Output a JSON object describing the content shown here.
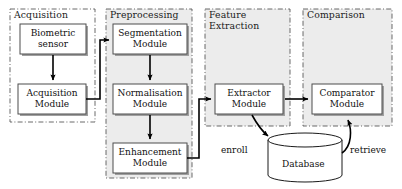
{
  "diagram": {
    "colors": {
      "container_fill_gray": "#ececec",
      "container_fill_white": "#ffffff",
      "container_border": "#555555",
      "module_fill": "#ffffff",
      "module_border": "#4d4d4d",
      "module_shadow": "#9a9a9a",
      "arrow": "#000000",
      "text": "#111111"
    },
    "stages": [
      {
        "key": "acquisition",
        "label": "Acquisition",
        "filled": false,
        "x": 10,
        "y": 9,
        "w": 85,
        "h": 113
      },
      {
        "key": "preprocessing",
        "label": "Preprocessing",
        "filled": true,
        "x": 106,
        "y": 9,
        "w": 86,
        "h": 169
      },
      {
        "key": "feature_extraction",
        "label": "Feature\nExtraction",
        "filled": true,
        "x": 205,
        "y": 9,
        "w": 85,
        "h": 117
      },
      {
        "key": "comparison",
        "label": "Comparison",
        "filled": true,
        "x": 303,
        "y": 9,
        "w": 89,
        "h": 117
      }
    ],
    "modules": [
      {
        "key": "biometric_sensor",
        "lines": [
          "Biometric",
          "sensor"
        ],
        "x": 20,
        "y": 24,
        "w": 66,
        "h": 30
      },
      {
        "key": "acquisition_module",
        "lines": [
          "Acquisition",
          "Module"
        ],
        "x": 18,
        "y": 84,
        "w": 68,
        "h": 30
      },
      {
        "key": "segmentation_module",
        "lines": [
          "Segmentation",
          "Module"
        ],
        "x": 113,
        "y": 24,
        "w": 74,
        "h": 30
      },
      {
        "key": "normalisation_module",
        "lines": [
          "Normalisation",
          "Module"
        ],
        "x": 113,
        "y": 84,
        "w": 74,
        "h": 30
      },
      {
        "key": "enhancement_module",
        "lines": [
          "Enhancement",
          "Module"
        ],
        "x": 113,
        "y": 143,
        "w": 74,
        "h": 30
      },
      {
        "key": "extractor_module",
        "lines": [
          "Extractor",
          "Module"
        ],
        "x": 215,
        "y": 84,
        "w": 68,
        "h": 30
      },
      {
        "key": "comparator_module",
        "lines": [
          "Comparator",
          "Module"
        ],
        "x": 312,
        "y": 84,
        "w": 70,
        "h": 30
      }
    ],
    "database": {
      "key": "database",
      "label": "Database",
      "cx": 305,
      "top": 133,
      "bottom": 182,
      "rx": 37,
      "ry": 7
    },
    "edge_labels": [
      {
        "key": "enroll",
        "label": "enroll",
        "x": 221,
        "y": 145
      },
      {
        "key": "retrieve",
        "label": "retrieve",
        "x": 350,
        "y": 145
      }
    ]
  }
}
